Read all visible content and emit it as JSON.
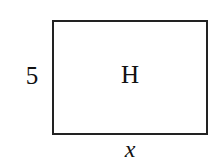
{
  "figure": {
    "type": "geometry-diagram",
    "shape": "rectangle",
    "background_color": "#ffffff",
    "stroke_color": "#222222",
    "text_color": "#111111"
  },
  "labels": {
    "height": "5",
    "interior": "H",
    "width": "x"
  },
  "geometry": {
    "rect_left": 52,
    "rect_top": 20,
    "rect_width": 152,
    "rect_height": 111,
    "border_px": 2
  }
}
